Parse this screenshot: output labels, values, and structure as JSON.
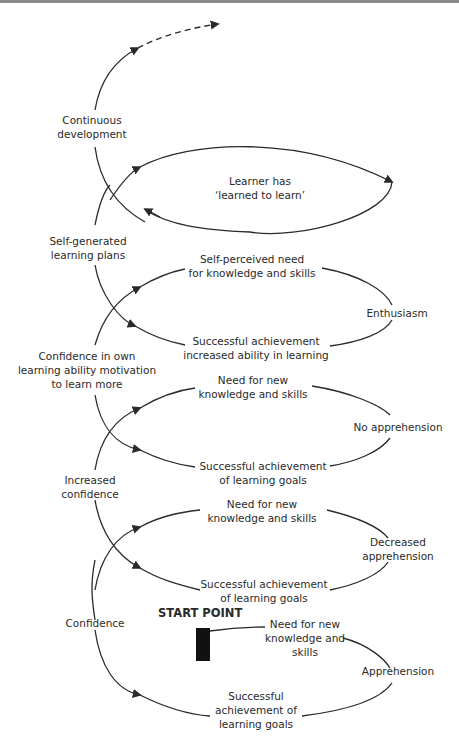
{
  "diagram": {
    "top_left_labels": [
      {
        "id": "continuous",
        "text1": "Continuous",
        "text2": "development"
      },
      {
        "id": "selfgen",
        "text1": "Self-generated",
        "text2": "learning plans"
      },
      {
        "id": "confown",
        "text1": "Confidence in own",
        "text2": "learning ability motivation",
        "text3": "to learn more"
      },
      {
        "id": "incconf",
        "text1": "Increased",
        "text2": "confidence"
      },
      {
        "id": "conf",
        "text1": "Confidence"
      }
    ],
    "loops": [
      {
        "id": "learned",
        "center1": "Learner has",
        "center2": "‘learned to learn’"
      },
      {
        "id": "loop4",
        "top1": "Self-perceived need",
        "top2": "for knowledge and skills",
        "right": "Enthusiasm",
        "bottom1": "Successful achievement",
        "bottom2": "increased ability in learning"
      },
      {
        "id": "loop3",
        "top1": "Need for new",
        "top2": "knowledge and skills",
        "right": "No apprehension",
        "bottom1": "Successful achievement",
        "bottom2": "of learning goals"
      },
      {
        "id": "loop2",
        "top1": "Need for new",
        "top2": "knowledge and skills",
        "right1": "Decreased",
        "right2": "apprehension",
        "bottom1": "Successful achievement",
        "bottom2": "of learning goals"
      },
      {
        "id": "loop1",
        "top1": "Need for new",
        "top2": "knowledge and",
        "top3": "skills",
        "right": "Apprehension",
        "bottom1": "Successful",
        "bottom2": "achievement of",
        "bottom3": "learning goals"
      }
    ],
    "start_label": "START POINT",
    "line_color": "#2a2a2a"
  }
}
